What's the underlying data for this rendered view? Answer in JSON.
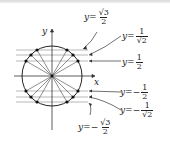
{
  "diagram": {
    "type": "unit-circle",
    "axes": {
      "x_label": "x",
      "y_label": "y"
    },
    "horizontal_lines": [
      {
        "name": "y=√3/2",
        "prefix": "y=",
        "sign": "",
        "num": "√3",
        "den": "2",
        "value": 0.866
      },
      {
        "name": "y=1/√2",
        "prefix": "y=",
        "sign": "",
        "num": "1",
        "den": "√2",
        "value": 0.707
      },
      {
        "name": "y=1/2",
        "prefix": "y=",
        "sign": "",
        "num": "1",
        "den": "2",
        "value": 0.5
      },
      {
        "name": "y=-1/2",
        "prefix": "y=",
        "sign": "−",
        "num": "1",
        "den": "2",
        "value": -0.5
      },
      {
        "name": "y=-1/√2",
        "prefix": "y=",
        "sign": "−",
        "num": "1",
        "den": "√2",
        "value": -0.707
      },
      {
        "name": "y=-√3/2",
        "prefix": "y=",
        "sign": "−",
        "num": "√3",
        "den": "2",
        "value": -0.866
      }
    ],
    "colors": {
      "line": "#333333",
      "guide": "#999999",
      "point": "#111111"
    }
  }
}
